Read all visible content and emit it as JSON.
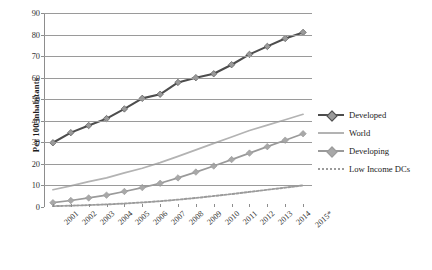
{
  "chart_data": {
    "type": "line",
    "title": "",
    "xlabel": "",
    "ylabel": "Per 100 inhabitants",
    "ylim": [
      0,
      90
    ],
    "yticks": [
      0,
      10,
      20,
      30,
      40,
      50,
      60,
      70,
      80,
      90
    ],
    "grid": true,
    "legend_position": "right",
    "categories": [
      "2001",
      "2002",
      "2003",
      "2004",
      "2005",
      "2006",
      "2007",
      "2008",
      "2009",
      "2010",
      "2011",
      "2012",
      "2013",
      "2014",
      "2015*"
    ],
    "series": [
      {
        "name": "Developed",
        "color": "#4d4d4d",
        "marker": "diamond",
        "marker_color": "#9a9a9a",
        "style": "solid",
        "values": [
          29.8,
          34.5,
          37.8,
          41.0,
          45.5,
          50.4,
          52.3,
          57.8,
          60.0,
          61.8,
          66.0,
          70.8,
          74.5,
          78.2,
          81.0
        ]
      },
      {
        "name": "World",
        "color": "#b3b3b3",
        "marker": "none",
        "marker_color": "#b3b3b3",
        "style": "solid",
        "values": [
          8.0,
          9.8,
          11.8,
          13.5,
          15.8,
          18.0,
          20.6,
          23.5,
          26.5,
          29.5,
          32.5,
          35.5,
          38.0,
          40.5,
          43.0
        ]
      },
      {
        "name": "Developing",
        "color": "#9a9a9a",
        "marker": "diamond",
        "marker_color": "#a8a8a8",
        "style": "solid",
        "values": [
          2.0,
          3.0,
          4.2,
          5.5,
          7.2,
          9.0,
          11.0,
          13.5,
          16.2,
          19.0,
          22.0,
          25.0,
          28.0,
          31.0,
          34.0
        ]
      },
      {
        "name": "Low Income DCs",
        "color": "#9b9b9b",
        "marker": "none",
        "marker_color": "#9b9b9b",
        "style": "dotted",
        "values": [
          0.4,
          0.6,
          0.9,
          1.2,
          1.6,
          2.1,
          2.7,
          3.4,
          4.2,
          5.1,
          6.0,
          7.0,
          8.0,
          9.0,
          10.0
        ]
      }
    ]
  },
  "caption": {
    "text": ""
  }
}
